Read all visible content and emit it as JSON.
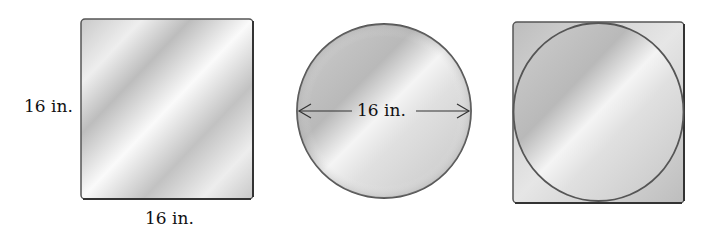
{
  "figures": {
    "square": {
      "side_label": "16 in.",
      "bottom_label": "16 in."
    },
    "circle": {
      "diameter_label": "16 in."
    },
    "circle_in_square": {}
  }
}
